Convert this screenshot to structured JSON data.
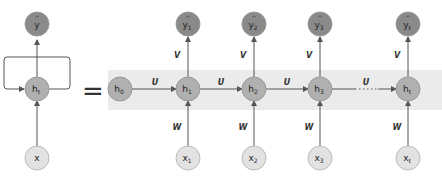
{
  "diagram": {
    "type": "rnn-unrolled",
    "folded": {
      "output": {
        "label": "y",
        "hat": "^"
      },
      "hidden": {
        "label": "h",
        "sub": "t"
      },
      "input": {
        "label": "x"
      }
    },
    "equals": "=",
    "unrolled": {
      "initial": {
        "label": "h",
        "sub": "0"
      },
      "steps": [
        {
          "hidden": {
            "label": "h",
            "sub": "1"
          },
          "output": {
            "label": "y",
            "sub": "1"
          },
          "input": {
            "label": "x",
            "sub": "1"
          }
        },
        {
          "hidden": {
            "label": "h",
            "sub": "2"
          },
          "output": {
            "label": "y",
            "sub": "2"
          },
          "input": {
            "label": "x",
            "sub": "2"
          }
        },
        {
          "hidden": {
            "label": "h",
            "sub": "3"
          },
          "output": {
            "label": "y",
            "sub": "3"
          },
          "input": {
            "label": "x",
            "sub": "3"
          }
        },
        {
          "hidden": {
            "label": "h",
            "sub": "t"
          },
          "output": {
            "label": "y",
            "sub": "t"
          },
          "input": {
            "label": "x",
            "sub": "t"
          }
        }
      ],
      "weights": {
        "recurrent": "U",
        "output": "V",
        "input": "W"
      },
      "ellipsis": "....."
    },
    "colors": {
      "output_node": "#8a8a8a",
      "hidden_node": "#b0b0b0",
      "input_node": "#e2e2e2",
      "band": "#ebebeb",
      "line": "#555555"
    }
  }
}
